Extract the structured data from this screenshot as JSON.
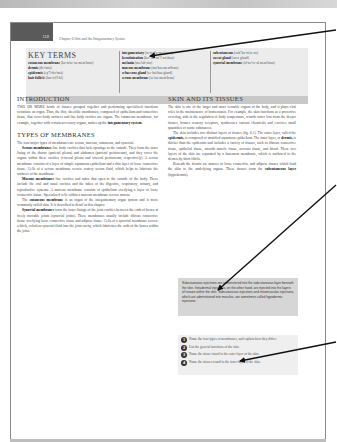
{
  "page": {
    "page_number": "118",
    "running_head": "Chapter 6  Skin and the Integumentary System"
  },
  "key_terms": {
    "title": "KEY TERMS",
    "columns": [
      [
        {
          "term": "cutaneous membrane",
          "pron": "(ku-ta'ne-us mem'brān)"
        },
        {
          "term": "dermis",
          "pron": "(der'mis)"
        },
        {
          "term": "epidermis",
          "pron": "(ep\"ĭ-der'mis)"
        },
        {
          "term": "hair follicle",
          "pron": "(hār fol'ĭ-kl)"
        }
      ],
      [
        {
          "term": "integumentary",
          "pron": "(in-teg\"u-men'tar-e)"
        },
        {
          "term": "keratinization",
          "pron": "(ker\"ah-tin\"ĭ-za'shun)"
        },
        {
          "term": "melanin",
          "pron": "(mel'ah-nin)"
        },
        {
          "term": "mucous membrane",
          "pron": "(mu'kus mem'brān)"
        },
        {
          "term": "sebaceous gland",
          "pron": "(se-ba'shus gland)"
        },
        {
          "term": "serous membrane",
          "pron": "(se'rus mem'brān)"
        }
      ],
      [
        {
          "term": "subcutaneous",
          "pron": "(sub\"ku-ta'ne-us)"
        },
        {
          "term": "sweat gland",
          "pron": "(swet gland)"
        },
        {
          "term": "synovial membrane",
          "pron": "(sĭ-no've-al mem'brān)"
        }
      ]
    ]
  },
  "left_column": {
    "intro_heading": "INTRODUCTION",
    "intro_text_1": "TWO OR MORE kinds of tissues grouped together and performing specialized functions constitute an organ. Thus, the thin, sheetlike membranes, composed of epithelium and connective tissue, that cover body surfaces and line body cavities are organs. The cutaneous membrane, for example, together with certain accessory organs, makes up the ",
    "intro_bold": "integumentary system.",
    "types_heading": "TYPES OF MEMBRANES",
    "types_text": "The four major types of membranes are serous, mucous, cutaneous, and synovial.",
    "serous_bold": "Serous membranes",
    "serous_text": " line body cavities that lack openings to the outside. They form the inner lining of the thorax (parietal pleura) and abdomen (parietal peritoneum), and they cover the organs within these cavities (visceral pleura and visceral peritoneum, respectively). A serous membrane consists of a layer of simple squamous epithelium and a thin layer of loose connective tissue. Cells of a serous membrane secrete watery serous fluid, which helps to lubricate the surfaces of the membrane.",
    "mucous_bold": "Mucous membranes",
    "mucous_text": " line cavities and tubes that open to the outside of the body. These include the oral and nasal cavities and the tubes of the digestive, respiratory, urinary, and reproductive systems. A mucous membrane consists of epithelium overlying a layer of loose connective tissue. Specialized cells within a mucous membrane secrete mucus.",
    "cutaneous_pre": "The ",
    "cutaneous_bold": "cutaneous membrane",
    "cutaneous_text": " is an organ of the integumentary organ system and is more commonly called skin. It is described in detail in this chapter.",
    "synovial_bold": "Synovial membranes",
    "synovial_text": " form the inner linings of the joint cavities between the ends of bones at freely movable joints (synovial joints). These membranes usually include fibrous connective tissue overlying loose connective tissue and adipose tissue. Cells of a synovial membrane secrete a thick, colorless synovial fluid into the joint cavity, which lubricates the ends of the bones within the joint."
  },
  "right_column": {
    "heading": "SKIN AND ITS TISSUES",
    "p1": "The skin is one of the larger and more versatile organs of the body, and it plays vital roles in the maintenance of homeostasis. For example, the skin functions as a protective covering, aids in the regulation of body temperature, retards water loss from the deeper tissues, houses sensory receptors, synthesizes various chemicals and excretes small quantities of waste substances.",
    "p2_a": "The skin includes two distinct layers of tissues (fig. 6.1). The outer layer, called the ",
    "p2_b1": "epidermis,",
    "p2_c": " is composed of stratified squamous epithelium. The inner layer, or ",
    "p2_b2": "dermis,",
    "p2_d": " is thicker than the epidermis and includes a variety of tissues, such as fibrous connective tissue, epithelial tissue, smooth muscle tissue, nervous tissue, and blood. These two layers of the skin are separated by a basement membrane, which is anchored to the dermis by short fibrils.",
    "p3_a": "Beneath the dermis are masses of loose connective and adipose tissues which bind the skin to the underlying organs. These tissues form the ",
    "p3_b": "subcutaneous layer",
    "p3_c": " (hypodermis)."
  },
  "note_box": {
    "text": "Subcutaneous injections are administered into the subcutaneous layer beneath the skin. Intradermal injections, on the other hand, are injected into the layers of tissues within the skin. Subcutaneous injections and intramuscular injections, which are administered into muscles, are sometimes called hypodermic injections."
  },
  "review_questions": [
    {
      "num": "1",
      "text": "Name the four types of membranes, and explain how they differ."
    },
    {
      "num": "2",
      "text": "List the general functions of the skin."
    },
    {
      "num": "3",
      "text": "Name the tissue found in the outer layer of the skin."
    },
    {
      "num": "4",
      "text": "Name the tissues found in the inner layer of the skin."
    }
  ],
  "annotations": {
    "arrow_color": "#111111"
  }
}
